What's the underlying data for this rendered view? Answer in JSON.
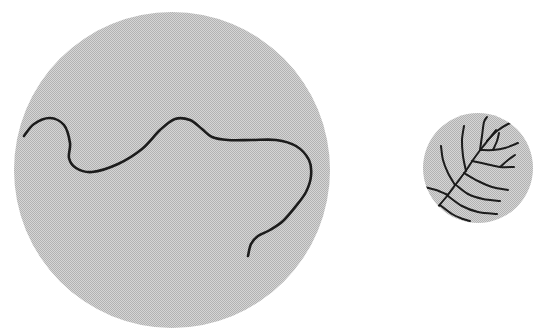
{
  "figure": {
    "title": "Two shaded circular fields containing ink line drawings",
    "background_color": "#ffffff",
    "canvas": {
      "width": 534,
      "height": 336
    },
    "fill_color": "#c6c6c6",
    "fill_texture": "halftone-checker-dither",
    "line_color": "#1a1a1a"
  },
  "panels": [
    {
      "id": "large-circle-panel",
      "name": "large-shaded-circle",
      "shape": "circle",
      "center_x": 172,
      "center_y": 170,
      "radius": 158,
      "fill_color": "#c6c6c6",
      "contents_name": "meandering-curve",
      "contents_description": "single continuous meandering wavy line",
      "stroke_width": 2.6,
      "curve_points": [
        [
          24,
          136
        ],
        [
          34,
          124
        ],
        [
          50,
          118
        ],
        [
          64,
          125
        ],
        [
          70,
          143
        ],
        [
          69,
          158
        ],
        [
          76,
          168
        ],
        [
          92,
          172
        ],
        [
          118,
          164
        ],
        [
          142,
          149
        ],
        [
          160,
          130
        ],
        [
          175,
          119
        ],
        [
          190,
          120
        ],
        [
          202,
          129
        ],
        [
          212,
          137
        ],
        [
          228,
          140
        ],
        [
          252,
          140
        ],
        [
          276,
          140
        ],
        [
          296,
          146
        ],
        [
          309,
          160
        ],
        [
          311,
          176
        ],
        [
          306,
          192
        ],
        [
          296,
          206
        ],
        [
          283,
          221
        ],
        [
          270,
          230
        ],
        [
          258,
          236
        ],
        [
          251,
          244
        ],
        [
          248,
          256
        ]
      ]
    },
    {
      "id": "small-circle-panel",
      "name": "small-shaded-circle",
      "shape": "circle",
      "center_x": 478,
      "center_y": 168,
      "radius": 55,
      "fill_color": "#c6c6c6",
      "contents_name": "branching-dendritic-pattern",
      "contents_description": "branched tree-like venation radiating from a stem at lower left",
      "stroke_width": 2.0,
      "stem_points": [
        [
          437,
          208
        ],
        [
          447,
          196
        ],
        [
          456,
          184
        ],
        [
          465,
          172
        ],
        [
          473,
          160
        ],
        [
          481,
          149
        ],
        [
          489,
          139
        ],
        [
          496,
          130
        ]
      ],
      "branches": [
        {
          "name": "branch-left-lower",
          "points": [
            [
              448,
              195
            ],
            [
              436,
              190
            ],
            [
              424,
              187
            ]
          ]
        },
        {
          "name": "branch-left-mid",
          "points": [
            [
              455,
              185
            ],
            [
              448,
              173
            ],
            [
              443,
              160
            ],
            [
              441,
              146
            ]
          ]
        },
        {
          "name": "branch-left-upper",
          "points": [
            [
              466,
              171
            ],
            [
              463,
              156
            ],
            [
              462,
              140
            ],
            [
              464,
              126
            ]
          ]
        },
        {
          "name": "branch-up-center",
          "points": [
            [
              480,
              150
            ],
            [
              482,
              136
            ],
            [
              484,
              122
            ],
            [
              487,
              117
            ]
          ]
        },
        {
          "name": "branch-right-upper",
          "points": [
            [
              487,
              141
            ],
            [
              497,
              131
            ],
            [
              508,
              124
            ],
            [
              517,
              121
            ]
          ]
        },
        {
          "name": "branch-right-mid",
          "points": [
            [
              481,
              150
            ],
            [
              493,
              150
            ],
            [
              505,
              148
            ],
            [
              518,
              143
            ]
          ]
        },
        {
          "name": "branch-right-lower",
          "points": [
            [
              472,
              161
            ],
            [
              486,
              164
            ],
            [
              500,
              167
            ],
            [
              514,
              167
            ]
          ]
        },
        {
          "name": "branch-right-low2",
          "points": [
            [
              464,
              173
            ],
            [
              478,
              181
            ],
            [
              492,
              187
            ],
            [
              508,
              190
            ]
          ]
        },
        {
          "name": "branch-lower-right-1",
          "points": [
            [
              456,
              185
            ],
            [
              468,
              194
            ],
            [
              483,
              199
            ],
            [
              500,
              201
            ]
          ]
        },
        {
          "name": "branch-lower-right-2",
          "points": [
            [
              448,
              196
            ],
            [
              462,
              206
            ],
            [
              478,
              212
            ],
            [
              497,
              214
            ]
          ]
        },
        {
          "name": "branch-bottom",
          "points": [
            [
              440,
              205
            ],
            [
              452,
              214
            ],
            [
              463,
              219
            ],
            [
              470,
              221
            ]
          ]
        },
        {
          "name": "branch-twig-a",
          "points": [
            [
              493,
              150
            ],
            [
              497,
              141
            ],
            [
              499,
              133
            ]
          ]
        },
        {
          "name": "branch-twig-b",
          "points": [
            [
              500,
              167
            ],
            [
              508,
              160
            ],
            [
              515,
              155
            ]
          ]
        }
      ]
    }
  ],
  "legend": {
    "visible": false,
    "items": []
  },
  "labels": {
    "visible": false,
    "items": []
  }
}
